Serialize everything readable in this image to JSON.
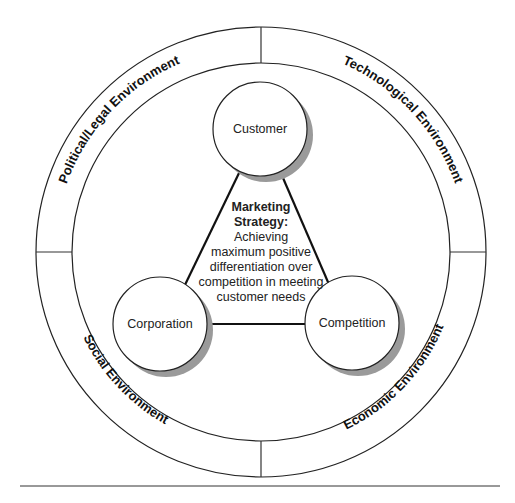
{
  "diagram": {
    "environments": [
      {
        "id": "political",
        "label": "Political/Legal Environment"
      },
      {
        "id": "technological",
        "label": "Technological Environment"
      },
      {
        "id": "social",
        "label": "Social Environment"
      },
      {
        "id": "economic",
        "label": "Economic Environment"
      }
    ],
    "nodes": [
      {
        "id": "customer",
        "label": "Customer"
      },
      {
        "id": "corporation",
        "label": "Corporation"
      },
      {
        "id": "competition",
        "label": "Competition"
      }
    ],
    "center": {
      "title_lines": [
        "Marketing",
        "Strategy:"
      ],
      "body_lines": [
        "Achieving",
        "maximum positive",
        "differentiation over",
        "competition in meeting",
        "customer needs"
      ]
    },
    "colors": {
      "line": "#222222",
      "shadow": "#9a9a9a",
      "background": "#ffffff"
    }
  }
}
